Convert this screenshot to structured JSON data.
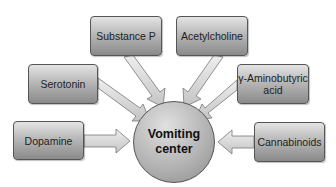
{
  "diagram": {
    "center": {
      "line1": "Vomiting",
      "line2": "center"
    },
    "nodes": {
      "substance_p": "Substance P",
      "acetylcholine": "Acetylcholine",
      "serotonin": "Serotonin",
      "gaba_line1": "γ-Aminobutyric",
      "gaba_line2": "acid",
      "dopamine": "Dopamine",
      "cannabinoids": "Cannabinoids"
    },
    "colors": {
      "box_fill_top": "#e4e4e4",
      "box_fill_bottom": "#8a8a8a",
      "arrow_fill": "#dcdcdc",
      "stroke": "#555555"
    }
  }
}
